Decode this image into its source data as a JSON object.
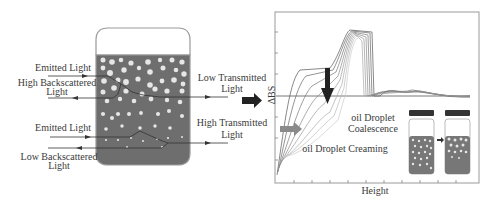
{
  "left_panel": {
    "labels": {
      "emitted_top": "Emitted Light",
      "high_backscattered_1": "High Backscattered",
      "high_backscattered_2": "Light",
      "emitted_bottom": "Emitted Light",
      "low_backscattered_1": "Low Backscattered",
      "low_backscattered_2": "Light",
      "low_transmitted_1": "Low Transmitted",
      "low_transmitted_2": "Light",
      "high_transmitted_1": "High Transmitted",
      "high_transmitted_2": "Light"
    }
  },
  "right_panel": {
    "y_axis_label": "ΔBS",
    "x_axis_label": "Height",
    "annotations": {
      "coalescence_1": "oil Droplet",
      "coalescence_2": "Coalescence",
      "creaming": "oil Droplet Creaming"
    }
  },
  "colors": {
    "liquid": "#6e6e6e",
    "droplet": "#e8e8e8",
    "arrow_dark": "#222222",
    "arrow_creaming": "#8a8a8a"
  }
}
